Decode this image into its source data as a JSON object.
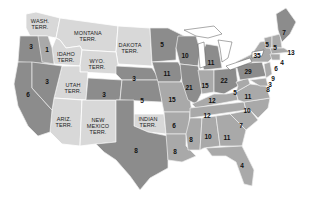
{
  "map": {
    "colors": {
      "territory": "#d8d8d8",
      "state_dark": "#8c8c8c",
      "state_mid": "#a9a9a9",
      "background": "#ffffff"
    },
    "territories": [
      {
        "id": "wash",
        "label": "WASH.\nTERR.",
        "line1": "WASH.",
        "line2": "TERR."
      },
      {
        "id": "montana",
        "line1": "MONTANA",
        "line2": "TERR."
      },
      {
        "id": "dakota",
        "line1": "DAKOTA",
        "line2": "TERR."
      },
      {
        "id": "idaho",
        "line1": "IDAHO",
        "line2": "TERR."
      },
      {
        "id": "wyo",
        "line1": "WYO.",
        "line2": "TERR."
      },
      {
        "id": "utah",
        "line1": "UTAH",
        "line2": "TERR."
      },
      {
        "id": "ariz",
        "line1": "ARIZ.",
        "line2": "TERR."
      },
      {
        "id": "newmexico",
        "line1": "NEW",
        "line2": "MEXICO",
        "line3": "TERR."
      },
      {
        "id": "indian",
        "line1": "INDIAN",
        "line2": "TERR."
      }
    ],
    "states": [
      {
        "name": "Oregon",
        "votes": "3"
      },
      {
        "name": "Oregon-east",
        "votes": "1"
      },
      {
        "name": "Nevada",
        "votes": "3"
      },
      {
        "name": "California",
        "votes": "6"
      },
      {
        "name": "Colorado",
        "votes": "3"
      },
      {
        "name": "Nebraska",
        "votes": "3"
      },
      {
        "name": "Kansas",
        "votes": "5"
      },
      {
        "name": "Texas",
        "votes": "8"
      },
      {
        "name": "Minnesota",
        "votes": "5"
      },
      {
        "name": "Iowa",
        "votes": "11"
      },
      {
        "name": "Missouri",
        "votes": "15"
      },
      {
        "name": "Arkansas",
        "votes": "6"
      },
      {
        "name": "Louisiana",
        "votes": "8"
      },
      {
        "name": "Wisconsin",
        "votes": "10"
      },
      {
        "name": "Illinois",
        "votes": "21"
      },
      {
        "name": "Michigan",
        "votes": "11"
      },
      {
        "name": "Indiana",
        "votes": "15"
      },
      {
        "name": "Ohio",
        "votes": "22"
      },
      {
        "name": "Kentucky",
        "votes": "12"
      },
      {
        "name": "Tennessee",
        "votes": "12"
      },
      {
        "name": "Mississippi",
        "votes": "8"
      },
      {
        "name": "Alabama",
        "votes": "10"
      },
      {
        "name": "Georgia",
        "votes": "11"
      },
      {
        "name": "Florida",
        "votes": "4"
      },
      {
        "name": "South Carolina",
        "votes": "7"
      },
      {
        "name": "North Carolina",
        "votes": "10"
      },
      {
        "name": "Virginia",
        "votes": "11"
      },
      {
        "name": "West Virginia",
        "votes": "5"
      },
      {
        "name": "Pennsylvania",
        "votes": "29"
      },
      {
        "name": "New York",
        "votes": "35"
      },
      {
        "name": "Vermont",
        "votes": "5"
      },
      {
        "name": "New Hampshire",
        "votes": "5"
      },
      {
        "name": "Maine",
        "votes": "7"
      },
      {
        "name": "Massachusetts",
        "votes": "13"
      },
      {
        "name": "Rhode Island",
        "votes": "4"
      },
      {
        "name": "Connecticut",
        "votes": "6"
      },
      {
        "name": "New Jersey",
        "votes": "9"
      },
      {
        "name": "Delaware",
        "votes": "3"
      },
      {
        "name": "Maryland",
        "votes": "8"
      }
    ]
  }
}
